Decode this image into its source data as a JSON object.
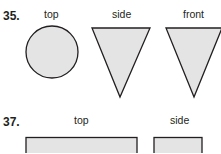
{
  "problems": [
    {
      "number": "35.",
      "views": [
        {
          "label": "top",
          "shape": "circle"
        },
        {
          "label": "side",
          "shape": "inverted-triangle"
        },
        {
          "label": "front",
          "shape": "inverted-triangle"
        }
      ]
    },
    {
      "number": "37.",
      "views": [
        {
          "label": "top",
          "shape": "rectangle"
        },
        {
          "label": "side",
          "shape": "rectangle"
        }
      ]
    }
  ],
  "colors": {
    "fill": "#e4e4e4",
    "stroke": "#231f20",
    "text": "#231f20"
  }
}
